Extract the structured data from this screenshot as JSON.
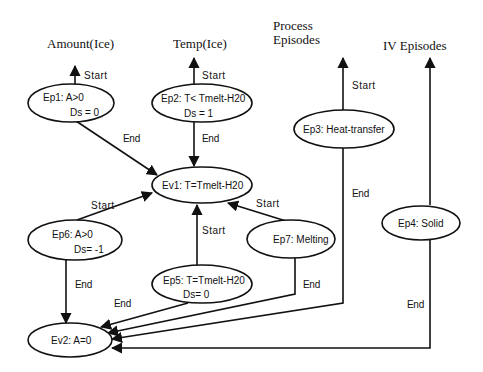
{
  "diagram": {
    "columns": [
      {
        "id": "amount",
        "label": "Amount(Ice)"
      },
      {
        "id": "temp",
        "label": "Temp(Ice)"
      },
      {
        "id": "process_line1",
        "label": "Process"
      },
      {
        "id": "process_line2",
        "label": "Episodes"
      },
      {
        "id": "iv",
        "label": "IV Episodes"
      }
    ],
    "nodes": {
      "ep1": {
        "line1": "Ep1:  A>0",
        "line2": "Ds = 0"
      },
      "ep2": {
        "line1": "Ep2:  T<  Tmelt-H20",
        "line2": "Ds = 1"
      },
      "ep3": {
        "line1": "Ep3:   Heat-transfer"
      },
      "ep4": {
        "line1": "Ep4:  Solid"
      },
      "ev1": {
        "line1": "Ev1:   T=Tmelt-H20"
      },
      "ep6": {
        "line1": "Ep6:  A>0",
        "line2": "Ds=  -1"
      },
      "ep5": {
        "line1": "Ep5:   T=Tmelt-H20",
        "line2": "Ds= 0"
      },
      "ep7": {
        "line1": "Ep7:  Melting"
      },
      "ev2": {
        "line1": "Ev2:  A=0"
      }
    },
    "edges": [
      {
        "id": "ep1-start",
        "from": "Ep1",
        "to": "Amount(Ice)",
        "label": "Start"
      },
      {
        "id": "ep2-start",
        "from": "Ep2",
        "to": "Temp(Ice)",
        "label": "Start"
      },
      {
        "id": "ep3-start",
        "from": "Ep3",
        "to": "Process Episodes",
        "label": "Start"
      },
      {
        "id": "ep4-start",
        "from": "Ep4",
        "to": "IV Episodes",
        "label": ""
      },
      {
        "id": "ep1-end",
        "from": "Ep1",
        "to": "Ev1",
        "label": "End"
      },
      {
        "id": "ep2-end",
        "from": "Ep2",
        "to": "Ev1",
        "label": "End"
      },
      {
        "id": "ep6-start",
        "from": "Ep6",
        "to": "Ev1",
        "label": "Start"
      },
      {
        "id": "ep5-start",
        "from": "Ep5",
        "to": "Ev1",
        "label": "Start"
      },
      {
        "id": "ep7-start",
        "from": "Ep7",
        "to": "Ev1",
        "label": "Start"
      },
      {
        "id": "ep6-end",
        "from": "Ep6",
        "to": "Ev2",
        "label": "End"
      },
      {
        "id": "ep5-end",
        "from": "Ep5",
        "to": "Ev2",
        "label": "End"
      },
      {
        "id": "ep7-end",
        "from": "Ep7",
        "to": "Ev2",
        "label": "End"
      },
      {
        "id": "ep3-end",
        "from": "Ep3",
        "to": "Ev2",
        "label": "End"
      },
      {
        "id": "ep4-end",
        "from": "Ep4",
        "to": "Ev2",
        "label": "End"
      }
    ],
    "colors": {
      "stroke": "#111111",
      "background": "#ffffff"
    }
  }
}
